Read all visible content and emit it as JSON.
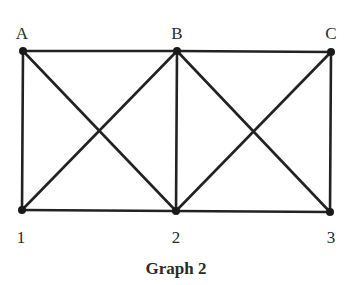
{
  "diagram": {
    "caption": "Graph 2",
    "style": {
      "edge_color": "#222222",
      "node_color": "#1a1a1a",
      "edge_width": 2.6,
      "node_radius": 4
    },
    "nodes": [
      {
        "id": "A",
        "label": "A",
        "x": 23,
        "y": 51,
        "label_x": 22,
        "label_y": 33
      },
      {
        "id": "B",
        "label": "B",
        "x": 177,
        "y": 51,
        "label_x": 177,
        "label_y": 33
      },
      {
        "id": "C",
        "label": "C",
        "x": 331,
        "y": 52,
        "label_x": 331,
        "label_y": 33
      },
      {
        "id": "1",
        "label": "1",
        "x": 22,
        "y": 210,
        "label_x": 21,
        "label_y": 237
      },
      {
        "id": "2",
        "label": "2",
        "x": 176,
        "y": 211,
        "label_x": 176,
        "label_y": 237
      },
      {
        "id": "3",
        "label": "3",
        "x": 330,
        "y": 212,
        "label_x": 331,
        "label_y": 237
      }
    ],
    "edges": [
      {
        "from": "A",
        "to": "B"
      },
      {
        "from": "B",
        "to": "C"
      },
      {
        "from": "1",
        "to": "2"
      },
      {
        "from": "2",
        "to": "3"
      },
      {
        "from": "A",
        "to": "1"
      },
      {
        "from": "B",
        "to": "2"
      },
      {
        "from": "C",
        "to": "3"
      },
      {
        "from": "A",
        "to": "2"
      },
      {
        "from": "B",
        "to": "1"
      },
      {
        "from": "B",
        "to": "3"
      },
      {
        "from": "C",
        "to": "2"
      }
    ]
  }
}
